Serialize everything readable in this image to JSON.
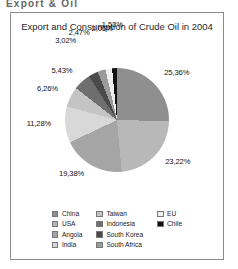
{
  "page": {
    "cropped_header_text": "Export & Oil"
  },
  "chart_data": {
    "type": "pie",
    "title": "Export and Consumption of Crude Oil in 2004",
    "xlabel": "",
    "ylabel": "",
    "legend_position": "bottom",
    "grid": false,
    "value_suffix": "%",
    "decimal_separator": ",",
    "categories": [
      "China",
      "USA",
      "Angola",
      "India",
      "Taiwan",
      "Indonesia",
      "South Korea",
      "South Africa",
      "EU",
      "Chile"
    ],
    "values": [
      25.36,
      23.22,
      19.38,
      11.28,
      6.26,
      5.43,
      3.02,
      2.47,
      2.06,
      1.53
    ],
    "colors": [
      "#8f8f8f",
      "#b8b8b8",
      "#a5a5a5",
      "#d8d8d8",
      "#c4c4c4",
      "#6e6e6e",
      "#4a4a4a",
      "#9b9b9b",
      "#efefef",
      "#111111"
    ],
    "labels": [
      {
        "text": "25,36%",
        "value": 25.36,
        "category": "China"
      },
      {
        "text": "23,22%",
        "value": 23.22,
        "category": "USA"
      },
      {
        "text": "19,38%",
        "value": 19.38,
        "category": "Angola"
      },
      {
        "text": "11,28%",
        "value": 11.28,
        "category": "India"
      },
      {
        "text": "6,26%",
        "value": 6.26,
        "category": "Taiwan"
      },
      {
        "text": "5,43%",
        "value": 5.43,
        "category": "Indonesia"
      },
      {
        "text": "3,02%",
        "value": 3.02,
        "category": "South Korea"
      },
      {
        "text": "2,47%",
        "value": 2.47,
        "category": "South Africa"
      },
      {
        "text": "2,06%",
        "value": 2.06,
        "category": "EU"
      },
      {
        "text": "1,53%",
        "value": 1.53,
        "category": "Chile"
      }
    ]
  },
  "legend": {
    "columns": [
      {
        "items": [
          {
            "label": "China",
            "color": "#8f8f8f"
          },
          {
            "label": "USA",
            "color": "#b8b8b8"
          },
          {
            "label": "Angola",
            "color": "#a5a5a5"
          },
          {
            "label": "India",
            "color": "#d8d8d8"
          }
        ]
      },
      {
        "items": [
          {
            "label": "Taiwan",
            "color": "#c4c4c4"
          },
          {
            "label": "Indonesia",
            "color": "#6e6e6e"
          },
          {
            "label": "South Korea",
            "color": "#4a4a4a"
          },
          {
            "label": "South Africa",
            "color": "#9b9b9b"
          }
        ]
      },
      {
        "items": [
          {
            "label": "EU",
            "color": "#efefef"
          },
          {
            "label": "Chile",
            "color": "#111111"
          }
        ]
      }
    ]
  }
}
